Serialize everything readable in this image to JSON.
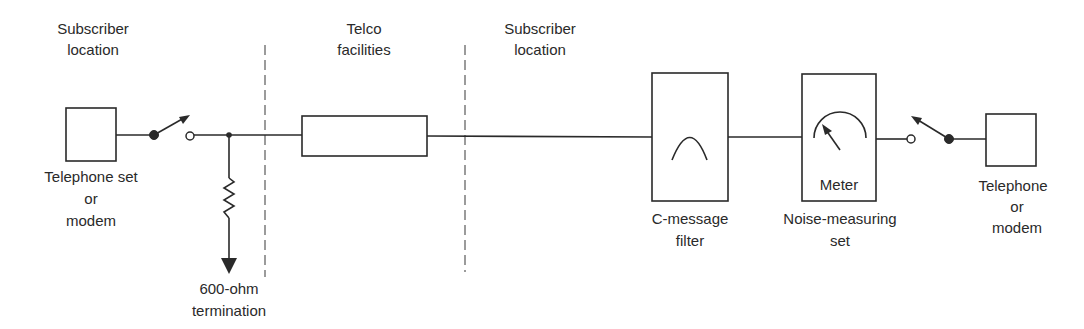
{
  "figure": {
    "type": "noise measurement test setup block diagram",
    "colors": {
      "line": "#2a2a2a",
      "background": "#ffffff"
    }
  },
  "regions": [
    {
      "id": "left",
      "label_line1": "Subscriber",
      "label_line2": "location"
    },
    {
      "id": "middle",
      "label_line1": "Telco",
      "label_line2": "facilities"
    },
    {
      "id": "right",
      "label_line1": "Subscriber",
      "label_line2": "location"
    }
  ],
  "components": {
    "left_terminal": {
      "line1": "Telephone set",
      "line2": "or",
      "line3": "modem"
    },
    "termination": {
      "line1": "600-ohm",
      "line2": "termination"
    },
    "telco_line": {
      "label": ""
    },
    "c_message_filter": {
      "line1": "C-message",
      "line2": "filter"
    },
    "noise_measuring_set": {
      "inner_label": "Meter",
      "line1": "Noise-measuring",
      "line2": "set"
    },
    "right_terminal": {
      "line1": "Telephone",
      "line2": "or",
      "line3": "modem"
    }
  },
  "icons": {
    "left_switch": "switch-open-icon",
    "right_switch": "switch-open-icon",
    "resistor": "resistor-icon",
    "ground": "ground-arrow-icon",
    "filter_response": "bandpass-curve-icon",
    "meter_dial": "meter-dial-icon"
  }
}
